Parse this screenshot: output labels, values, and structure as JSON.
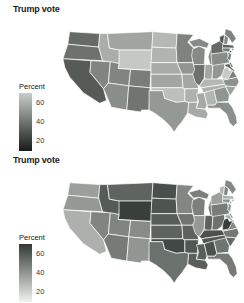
{
  "chart_data": {
    "type": "choropleth",
    "geography": "United States, lower 48 states",
    "variable": "Trump vote (percent)",
    "legend_domain": [
      70,
      10
    ],
    "panels": [
      {
        "title": "Trump vote",
        "legend_title": "Percent",
        "legend_ticks": [
          60,
          40,
          20
        ],
        "scale": {
          "direction": "light = high percent",
          "high": "#c9cec9",
          "low": "#161b19"
        }
      },
      {
        "title": "Trump vote",
        "legend_title": "Percent",
        "legend_ticks": [
          60,
          40,
          20
        ],
        "scale": {
          "direction": "dark = high percent",
          "high": "#333a36",
          "low": "#f1f2f0"
        }
      }
    ],
    "values": {
      "WA": 36.8,
      "OR": 39.1,
      "CA": 31.6,
      "NV": 45.5,
      "ID": 59.3,
      "MT": 56.2,
      "WY": 68.2,
      "UT": 45.5,
      "CO": 43.3,
      "AZ": 48.7,
      "NM": 40.0,
      "ND": 63.0,
      "SD": 61.5,
      "NE": 58.7,
      "KS": 56.7,
      "OK": 65.3,
      "TX": 52.2,
      "MN": 44.9,
      "IA": 51.1,
      "MO": 56.8,
      "AR": 60.6,
      "LA": 58.1,
      "WI": 47.2,
      "IL": 38.8,
      "MI": 47.5,
      "IN": 56.8,
      "OH": 51.7,
      "KY": 62.5,
      "TN": 60.7,
      "MS": 57.9,
      "AL": 62.1,
      "GA": 50.8,
      "FL": 49.0,
      "SC": 54.9,
      "NC": 49.8,
      "VA": 44.4,
      "WV": 68.5,
      "PA": 48.2,
      "NY": 36.5,
      "VT": 30.3,
      "NH": 46.5,
      "ME": 44.9,
      "MA": 32.8,
      "RI": 38.9,
      "CT": 40.9,
      "NJ": 41.4,
      "DE": 41.7,
      "MD": 33.9
    }
  }
}
